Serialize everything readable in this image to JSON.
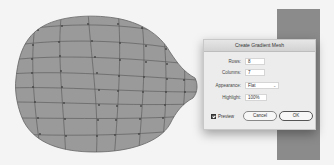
{
  "canvas": {
    "background": "#f4f4f4",
    "side_strip_color": "#8b8b8b",
    "mesh_fill": "#9a9a9a",
    "mesh_line": "#555555",
    "mesh_rows": 8,
    "mesh_columns": 7
  },
  "dialog": {
    "title": "Create Gradient Mesh",
    "fields": {
      "rows": {
        "label": "Rows:",
        "value": "8"
      },
      "columns": {
        "label": "Columns:",
        "value": "7"
      },
      "appearance": {
        "label": "Appearance:",
        "value": "Flat"
      },
      "highlight": {
        "label": "Highlight:",
        "value": "100%"
      }
    },
    "preview": {
      "label": "Preview",
      "checked": true
    },
    "buttons": {
      "cancel": "Cancel",
      "ok": "OK"
    }
  }
}
